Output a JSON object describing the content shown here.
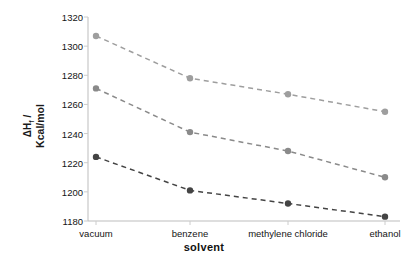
{
  "chart_data": {
    "type": "line",
    "title": "",
    "xlabel": "solvent",
    "ylabel": "ΔHf / Kcal/mol",
    "ylabel_line1": "ΔH",
    "ylabel_sub": "f",
    "ylabel_slash": " /",
    "ylabel_line2": "Kcal/mol",
    "categories": [
      "vacuum",
      "benzene",
      "methylene chloride",
      "ethanol"
    ],
    "ylim": [
      1180,
      1320
    ],
    "yticks": [
      1180,
      1200,
      1220,
      1240,
      1260,
      1280,
      1300,
      1320
    ],
    "grid": false,
    "legend": "none",
    "linestyle": "dashed",
    "marker": "circle",
    "series": [
      {
        "name": "series-1",
        "color": "#9e9e9e",
        "values": [
          1307,
          1278,
          1267,
          1255
        ]
      },
      {
        "name": "series-2",
        "color": "#8a8a8a",
        "values": [
          1271,
          1241,
          1228,
          1210
        ]
      },
      {
        "name": "series-3",
        "color": "#444444",
        "values": [
          1224,
          1201,
          1192,
          1183
        ]
      }
    ]
  },
  "axis": {
    "line_color": "#bdbdbd",
    "tick_color": "#cccccc"
  }
}
